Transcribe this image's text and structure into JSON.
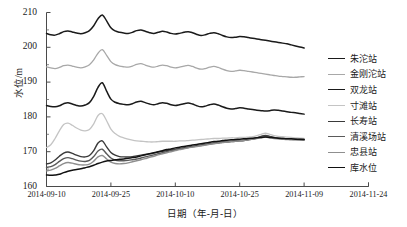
{
  "chart_data": {
    "type": "line",
    "title": "",
    "xlabel": "日期（年-月-日）",
    "ylabel": "水位/m",
    "ylim": [
      160,
      210
    ],
    "yticks": [
      160,
      170,
      180,
      190,
      200,
      210
    ],
    "xticks": [
      "2014-09-10",
      "2014-09-25",
      "2014-10-10",
      "2014-10-25",
      "2014-11-09",
      "2014-11-24"
    ],
    "x_start": "2014-09-10",
    "x_end": "2014-11-24",
    "data_end": "2014-11-09",
    "grid": false,
    "legend_position": "right",
    "x": [
      0,
      1,
      2,
      3,
      4,
      5,
      6,
      7,
      8,
      9,
      10,
      11,
      12,
      13,
      14,
      15,
      16,
      17,
      18,
      19,
      20,
      21,
      22,
      23,
      24,
      25,
      26,
      27,
      28,
      29,
      30,
      31,
      32,
      33,
      34,
      35,
      36,
      37,
      38,
      39,
      40,
      41,
      42,
      43,
      44,
      45,
      46,
      47,
      48,
      49,
      50,
      51,
      52,
      53,
      54,
      55,
      56,
      57,
      58,
      59,
      60
    ],
    "series": [
      {
        "name": "朱沱站",
        "color": "#1a1a1a",
        "width": 1.5,
        "values": [
          204.0,
          203.6,
          203.5,
          203.9,
          204.5,
          204.7,
          204.4,
          204.1,
          203.9,
          204.2,
          204.8,
          206.2,
          208.2,
          209.3,
          207.6,
          205.6,
          204.7,
          204.3,
          204.1,
          204.0,
          204.3,
          204.8,
          205.0,
          204.6,
          204.2,
          204.0,
          204.3,
          204.6,
          204.4,
          204.0,
          203.8,
          204.0,
          204.3,
          204.5,
          204.2,
          203.7,
          203.4,
          203.6,
          204.0,
          204.2,
          203.9,
          203.4,
          203.0,
          202.8,
          202.9,
          203.1,
          203.0,
          202.8,
          202.6,
          202.4,
          202.2,
          202.0,
          201.8,
          201.6,
          201.4,
          201.2,
          201.0,
          200.7,
          200.4,
          200.1,
          199.8
        ]
      },
      {
        "name": "金刚沱站",
        "color": "#a8a8a8",
        "width": 1.3,
        "values": [
          194.4,
          194.1,
          193.9,
          194.2,
          194.7,
          194.9,
          194.6,
          194.3,
          194.1,
          194.4,
          195.0,
          196.4,
          198.3,
          199.3,
          197.7,
          195.9,
          195.0,
          194.6,
          194.4,
          194.3,
          194.6,
          195.1,
          195.3,
          194.9,
          194.5,
          194.3,
          194.6,
          194.9,
          194.7,
          194.3,
          194.1,
          194.3,
          194.6,
          194.8,
          194.5,
          194.0,
          193.7,
          193.9,
          194.3,
          194.5,
          194.2,
          193.7,
          193.3,
          193.1,
          193.2,
          193.4,
          193.3,
          193.1,
          192.9,
          192.7,
          192.5,
          192.3,
          192.1,
          191.9,
          191.7,
          191.6,
          191.5,
          191.4,
          191.4,
          191.5,
          191.6
        ]
      },
      {
        "name": "双龙站",
        "color": "#1a1a1a",
        "width": 1.5,
        "values": [
          183.3,
          183.0,
          182.9,
          183.2,
          183.8,
          184.1,
          183.7,
          183.3,
          183.1,
          183.4,
          184.1,
          185.9,
          188.5,
          189.8,
          187.4,
          185.1,
          184.2,
          183.8,
          183.6,
          183.5,
          183.8,
          184.3,
          184.5,
          184.1,
          183.7,
          183.5,
          183.8,
          184.1,
          183.9,
          183.5,
          183.3,
          183.5,
          183.8,
          184.0,
          183.7,
          183.2,
          182.9,
          183.1,
          183.5,
          183.7,
          183.4,
          182.9,
          182.5,
          182.3,
          182.4,
          182.6,
          182.5,
          182.3,
          182.1,
          181.9,
          181.8,
          181.7,
          181.8,
          182.0,
          181.9,
          181.7,
          181.5,
          181.3,
          181.2,
          181.0,
          180.8
        ]
      },
      {
        "name": "寸滩站",
        "color": "#c4c4c4",
        "width": 1.3,
        "values": [
          171.2,
          172.0,
          173.8,
          176.0,
          177.8,
          178.2,
          177.6,
          176.8,
          176.2,
          176.0,
          176.4,
          178.0,
          180.4,
          180.9,
          178.9,
          176.5,
          175.2,
          174.4,
          174.0,
          173.6,
          173.3,
          173.1,
          173.0,
          172.9,
          172.8,
          172.8,
          172.9,
          173.0,
          173.0,
          173.0,
          173.0,
          173.1,
          173.1,
          173.2,
          173.3,
          173.4,
          173.5,
          173.6,
          173.7,
          173.8,
          173.8,
          173.9,
          173.9,
          174.0,
          174.0,
          174.1,
          174.1,
          174.2,
          174.3,
          174.6,
          175.0,
          175.3,
          175.0,
          174.6,
          174.4,
          174.3,
          174.2,
          174.1,
          174.0,
          173.9,
          173.8
        ]
      },
      {
        "name": "长寿站",
        "color": "#3a3a3a",
        "width": 1.4,
        "values": [
          166.5,
          166.8,
          167.6,
          168.7,
          169.6,
          169.9,
          169.5,
          169.0,
          168.6,
          168.5,
          168.9,
          170.3,
          172.5,
          173.1,
          171.4,
          169.8,
          169.0,
          168.6,
          168.5,
          168.5,
          168.6,
          168.8,
          169.0,
          169.2,
          169.4,
          169.6,
          169.9,
          170.1,
          170.3,
          170.5,
          170.7,
          170.9,
          171.1,
          171.3,
          171.5,
          171.7,
          171.9,
          172.1,
          172.3,
          172.5,
          172.6,
          172.8,
          172.9,
          173.0,
          173.1,
          173.2,
          173.3,
          173.5,
          173.7,
          174.0,
          174.4,
          174.7,
          174.4,
          174.1,
          173.9,
          173.8,
          173.7,
          173.6,
          173.6,
          173.5,
          173.5
        ]
      },
      {
        "name": "清溪场站",
        "color": "#5a5a5a",
        "width": 1.4,
        "values": [
          165.5,
          165.7,
          166.3,
          167.2,
          168.0,
          168.3,
          168.0,
          167.6,
          167.3,
          167.2,
          167.5,
          168.6,
          170.2,
          170.7,
          169.4,
          168.2,
          167.6,
          167.4,
          167.4,
          167.5,
          167.7,
          167.9,
          168.2,
          168.5,
          168.8,
          169.1,
          169.4,
          169.7,
          170.0,
          170.3,
          170.5,
          170.8,
          171.0,
          171.2,
          171.4,
          171.6,
          171.8,
          172.0,
          172.2,
          172.4,
          172.5,
          172.7,
          172.8,
          172.9,
          173.0,
          173.1,
          173.2,
          173.4,
          173.6,
          173.9,
          174.2,
          174.4,
          174.2,
          174.0,
          173.8,
          173.7,
          173.6,
          173.5,
          173.5,
          173.4,
          173.4
        ]
      },
      {
        "name": "忠县站",
        "color": "#8f8f8f",
        "width": 1.4,
        "values": [
          164.5,
          164.7,
          165.2,
          165.9,
          166.6,
          166.9,
          166.7,
          166.4,
          166.2,
          166.2,
          166.4,
          167.3,
          168.5,
          168.9,
          167.9,
          167.0,
          166.6,
          166.5,
          166.6,
          166.8,
          167.1,
          167.4,
          167.7,
          168.0,
          168.4,
          168.7,
          169.1,
          169.4,
          169.7,
          170.0,
          170.3,
          170.6,
          170.8,
          171.1,
          171.3,
          171.5,
          171.7,
          171.9,
          172.1,
          172.3,
          172.5,
          172.6,
          172.8,
          172.9,
          173.0,
          173.1,
          173.2,
          173.4,
          173.6,
          173.8,
          174.0,
          174.2,
          174.0,
          173.8,
          173.7,
          173.6,
          173.5,
          173.5,
          173.4,
          173.4,
          173.3
        ]
      },
      {
        "name": "库水位",
        "color": "#111111",
        "width": 1.5,
        "values": [
          163.3,
          163.2,
          163.3,
          163.5,
          164.0,
          164.4,
          164.7,
          164.9,
          165.1,
          165.4,
          165.7,
          166.1,
          166.6,
          167.0,
          167.3,
          167.5,
          167.7,
          167.8,
          167.9,
          168.1,
          168.3,
          168.5,
          168.8,
          169.1,
          169.4,
          169.7,
          170.0,
          170.3,
          170.6,
          170.8,
          171.1,
          171.3,
          171.5,
          171.7,
          171.9,
          172.1,
          172.3,
          172.5,
          172.7,
          172.9,
          173.0,
          173.2,
          173.3,
          173.4,
          173.5,
          173.6,
          173.7,
          173.8,
          173.9,
          174.0,
          174.1,
          174.2,
          174.1,
          174.0,
          173.9,
          173.8,
          173.7,
          173.7,
          173.6,
          173.6,
          173.5
        ]
      }
    ]
  },
  "legend": {
    "items": [
      {
        "label": "朱沱站"
      },
      {
        "label": "金刚沱站"
      },
      {
        "label": "双龙站"
      },
      {
        "label": "寸滩站"
      },
      {
        "label": "长寿站"
      },
      {
        "label": "清溪场站"
      },
      {
        "label": "忠县站"
      },
      {
        "label": "库水位"
      }
    ]
  },
  "axes": {
    "y_title": "水位/m",
    "x_title": "日期（年-月-日）",
    "yticks": [
      "160",
      "170",
      "180",
      "190",
      "200",
      "210"
    ],
    "xticks": [
      "2014-09-10",
      "2014-09-25",
      "2014-10-10",
      "2014-10-25",
      "2014-11-09",
      "2014-11-24"
    ]
  }
}
